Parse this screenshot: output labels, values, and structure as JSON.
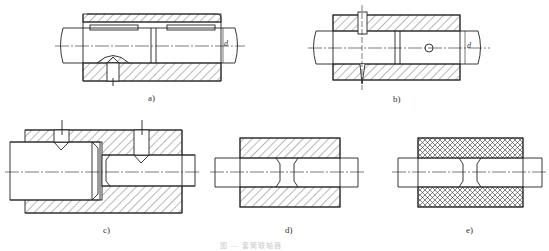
{
  "figure": {
    "panels": [
      {
        "id": "a",
        "label": "a)",
        "description": "Sleeve coupling with two keys and set screw",
        "dimension": "d"
      },
      {
        "id": "b",
        "label": "b)",
        "description": "Sleeve coupling with taper pin",
        "dimension": "d"
      },
      {
        "id": "c",
        "label": "c)",
        "description": "Stepped sleeve coupling with two set screws"
      },
      {
        "id": "d",
        "label": "d)",
        "description": "Sleeve with hatched section"
      },
      {
        "id": "e",
        "label": "e)",
        "description": "Sleeve with cross-hatched (non-metal) section"
      }
    ],
    "caption": "图 — 套筒联轴器"
  },
  "colors": {
    "line": "#222222",
    "background": "#ffffff"
  }
}
